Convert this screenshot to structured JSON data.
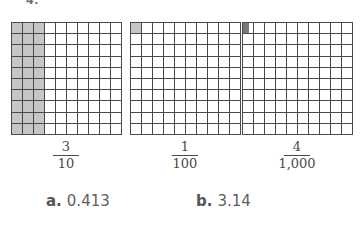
{
  "worksheet": {
    "question_number": "4.",
    "grid_rows": 10,
    "grid_cols": 10,
    "shade_color": "#c6c6c6",
    "line_color": "#4a4a4a"
  },
  "models": [
    {
      "id": "tenths-grid",
      "fraction_numerator": "3",
      "fraction_denominator": "10",
      "shaded_columns": 3,
      "shading_mode": "columns",
      "subdivided_cell": false
    },
    {
      "id": "hundredths-grid",
      "fraction_numerator": "1",
      "fraction_denominator": "100",
      "shaded_cells": 1,
      "shading_mode": "cells",
      "subdivided_cell": false
    },
    {
      "id": "thousandths-grid",
      "fraction_numerator": "4",
      "fraction_denominator": "1,000",
      "shaded_cells": 0,
      "shading_mode": "subdivided",
      "subdivided_cell": true,
      "subdivision_shaded_strips": 4,
      "subdivision_total_strips": 10
    }
  ],
  "choices": [
    {
      "letter": "a.",
      "value": "0.413"
    },
    {
      "letter": "b.",
      "value": "3.14"
    }
  ]
}
